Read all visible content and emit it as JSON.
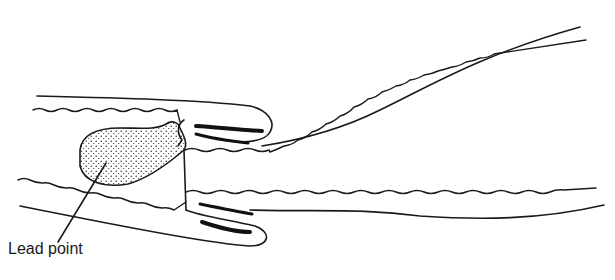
{
  "diagram": {
    "type": "intussusception illustration",
    "labels": {
      "lead_point": "Lead point"
    },
    "colors": {
      "ink": "#1a1a1a",
      "background": "#ffffff"
    }
  }
}
